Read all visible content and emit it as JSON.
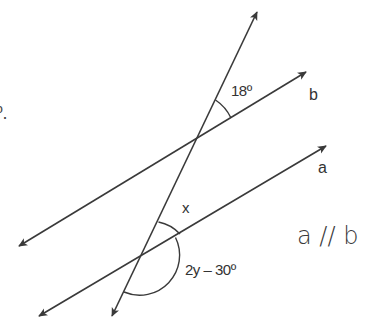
{
  "figure": {
    "stroke_color": "#3a3a3a",
    "text_color": "#333333",
    "background": "#ffffff"
  },
  "labels": {
    "fragment": "º.",
    "angle_top": "18º",
    "line_b": "b",
    "line_a": "a",
    "angle_x": "x",
    "angle_bottom": "2y – 30º",
    "parallel_statement": "a // b"
  }
}
